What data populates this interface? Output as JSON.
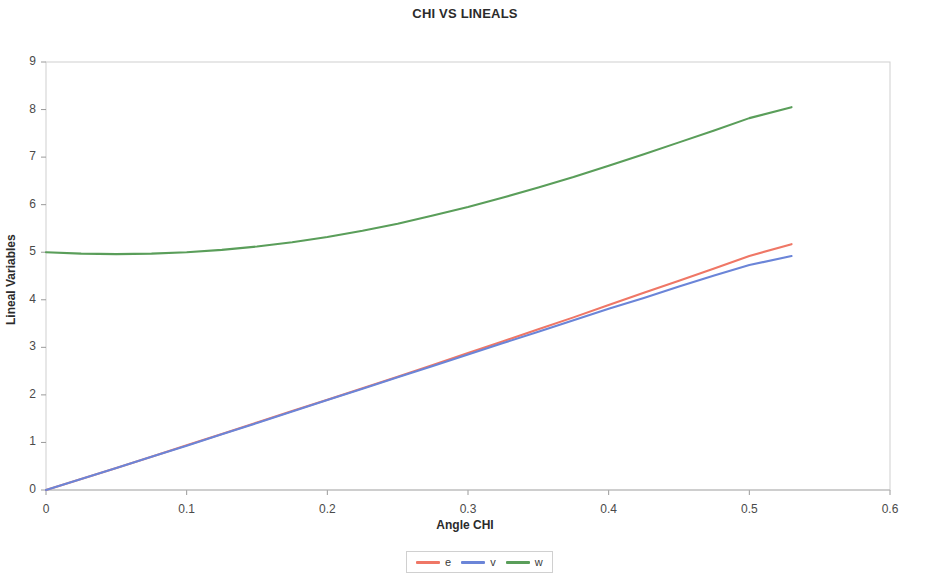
{
  "chart_data": {
    "type": "line",
    "title": "CHI VS LINEALS",
    "xlabel": "Angle CHI",
    "ylabel": "Lineal Variables",
    "xlim": [
      0,
      0.6
    ],
    "ylim": [
      0,
      9
    ],
    "xticks": [
      "0",
      "0.1",
      "0.2",
      "0.3",
      "0.4",
      "0.5",
      "0.6"
    ],
    "xtick_values": [
      0,
      0.1,
      0.2,
      0.3,
      0.4,
      0.5,
      0.6
    ],
    "yticks": [
      "0",
      "1",
      "2",
      "3",
      "4",
      "5",
      "6",
      "7",
      "8",
      "9"
    ],
    "ytick_values": [
      0,
      1,
      2,
      3,
      4,
      5,
      6,
      7,
      8,
      9
    ],
    "grid": false,
    "legend_position": "bottom",
    "series": [
      {
        "name": "e",
        "color": "#ef7766",
        "x": [
          0.0,
          0.025,
          0.05,
          0.075,
          0.1,
          0.125,
          0.15,
          0.175,
          0.2,
          0.225,
          0.25,
          0.275,
          0.3,
          0.325,
          0.35,
          0.375,
          0.4,
          0.425,
          0.45,
          0.475,
          0.5,
          0.53
        ],
        "values": [
          0.0,
          0.23,
          0.46,
          0.7,
          0.94,
          1.18,
          1.42,
          1.66,
          1.9,
          2.14,
          2.38,
          2.63,
          2.88,
          3.13,
          3.38,
          3.63,
          3.89,
          4.15,
          4.4,
          4.66,
          4.92,
          5.17
        ]
      },
      {
        "name": "v",
        "color": "#6b85d8",
        "x": [
          0.0,
          0.025,
          0.05,
          0.075,
          0.1,
          0.125,
          0.15,
          0.175,
          0.2,
          0.225,
          0.25,
          0.275,
          0.3,
          0.325,
          0.35,
          0.375,
          0.4,
          0.425,
          0.45,
          0.475,
          0.5,
          0.53
        ],
        "values": [
          0.0,
          0.23,
          0.46,
          0.7,
          0.93,
          1.17,
          1.41,
          1.65,
          1.89,
          2.13,
          2.37,
          2.61,
          2.85,
          3.09,
          3.33,
          3.57,
          3.81,
          4.04,
          4.28,
          4.51,
          4.73,
          4.92
        ]
      },
      {
        "name": "w",
        "color": "#5a9e5a",
        "x": [
          0.0,
          0.025,
          0.05,
          0.075,
          0.1,
          0.125,
          0.15,
          0.175,
          0.2,
          0.225,
          0.25,
          0.275,
          0.3,
          0.325,
          0.35,
          0.375,
          0.4,
          0.425,
          0.45,
          0.475,
          0.5,
          0.53
        ],
        "values": [
          5.0,
          4.97,
          4.96,
          4.97,
          5.0,
          5.05,
          5.12,
          5.21,
          5.32,
          5.45,
          5.6,
          5.77,
          5.95,
          6.15,
          6.36,
          6.58,
          6.82,
          7.06,
          7.31,
          7.56,
          7.82,
          8.05
        ]
      }
    ]
  },
  "legend": {
    "entries": [
      {
        "label": "e",
        "color": "#ef7766"
      },
      {
        "label": "v",
        "color": "#6b85d8"
      },
      {
        "label": "w",
        "color": "#5a9e5a"
      }
    ]
  },
  "axes": {
    "frame_color": "#cfcfcf",
    "tick_color": "#9a9a9a",
    "text_color": "#4a4a4a"
  }
}
